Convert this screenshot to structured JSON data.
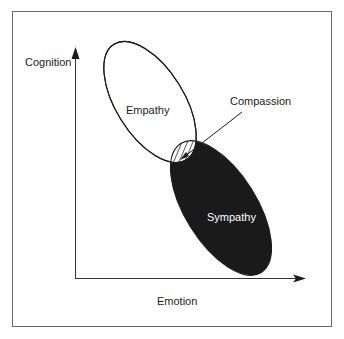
{
  "diagram": {
    "axes": {
      "y_label": "Cognition",
      "x_label": "Emotion"
    },
    "regions": [
      {
        "name": "Empathy",
        "fill": "#ffffff",
        "stroke": "#1a1a1a"
      },
      {
        "name": "Sympathy",
        "fill": "#1a1a1a",
        "text_color": "#ffffff"
      },
      {
        "name": "Compassion",
        "fill": "hatched",
        "description": "overlap of Empathy and Sympathy"
      }
    ],
    "labels": {
      "empathy": "Empathy",
      "sympathy": "Sympathy",
      "compassion": "Compassion"
    },
    "colors": {
      "frame": "#666666",
      "axis": "#333333",
      "dark_fill": "#1a1a1a"
    }
  }
}
